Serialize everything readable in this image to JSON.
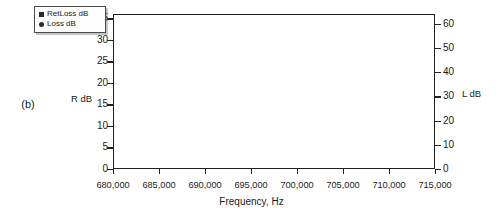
{
  "figure": {
    "panel_label": "(b)",
    "ylabel_left": "R dB",
    "ylabel_right": "L dB",
    "xlabel": "Frequency, Hz"
  },
  "legend": {
    "position": "top-left",
    "entries": [
      {
        "label": "RetLoss dB",
        "marker": "square-marker-icon",
        "color": "#2a2a2a"
      },
      {
        "label": "Loss dB",
        "marker": "round-marker-icon",
        "color": "#2a2a2a"
      }
    ]
  },
  "axes": {
    "x_ticks": [
      "680,000",
      "685,000",
      "690,000",
      "695,000",
      "700,000",
      "705,000",
      "710,000",
      "715,000"
    ],
    "y_ticks_left": [
      "0",
      "5",
      "10",
      "15",
      "20",
      "25",
      "30",
      "35"
    ],
    "y_ticks_right": [
      "0",
      "10",
      "20",
      "30",
      "40",
      "50",
      "60"
    ]
  },
  "chart_data": {
    "type": "line",
    "title": "",
    "xlabel": "Frequency, Hz",
    "ylabel": "R dB",
    "ylabel_secondary": "L dB",
    "xlim": [
      680000,
      715000
    ],
    "ylim": [
      0,
      36
    ],
    "ylim_secondary": [
      0,
      64
    ],
    "grid": true,
    "legend_position": "top-left",
    "series": [
      {
        "name": "Loss dB",
        "axis": "right",
        "marker": "round",
        "color": "#2a2a2a",
        "points": [
          [
            680000,
            64.0
          ],
          [
            680800,
            63.2
          ],
          [
            681600,
            62.2
          ],
          [
            682400,
            61.0
          ],
          [
            683200,
            59.7
          ],
          [
            684000,
            58.2
          ],
          [
            684800,
            56.6
          ],
          [
            685600,
            54.9
          ],
          [
            686400,
            53.0
          ],
          [
            687200,
            51.0
          ],
          [
            688000,
            48.8
          ],
          [
            688800,
            46.4
          ],
          [
            689600,
            43.8
          ],
          [
            690400,
            40.8
          ],
          [
            691200,
            37.5
          ],
          [
            691800,
            34.6
          ],
          [
            692400,
            31.2
          ],
          [
            692900,
            28.2
          ],
          [
            693200,
            25.8
          ],
          [
            693450,
            24.0
          ],
          [
            693600,
            26.5
          ],
          [
            693700,
            23.0
          ],
          [
            693800,
            10.0
          ],
          [
            693900,
            1.2
          ],
          [
            694100,
            0.5
          ],
          [
            695000,
            0.4
          ],
          [
            696000,
            0.4
          ],
          [
            697000,
            0.5
          ],
          [
            698000,
            0.5
          ],
          [
            699000,
            0.4
          ],
          [
            699800,
            0.5
          ],
          [
            700000,
            1.0
          ],
          [
            700150,
            10.0
          ],
          [
            700250,
            22.0
          ],
          [
            700400,
            25.5
          ],
          [
            700700,
            23.2
          ],
          [
            701000,
            21.6
          ],
          [
            701400,
            21.0
          ],
          [
            701800,
            22.0
          ],
          [
            702400,
            24.4
          ],
          [
            703200,
            28.2
          ],
          [
            704000,
            31.8
          ],
          [
            704800,
            35.2
          ],
          [
            705600,
            38.3
          ],
          [
            706400,
            41.2
          ],
          [
            707200,
            43.8
          ],
          [
            708000,
            46.2
          ],
          [
            708800,
            48.4
          ],
          [
            709600,
            50.4
          ],
          [
            710400,
            52.3
          ],
          [
            711200,
            54.0
          ],
          [
            712000,
            55.6
          ],
          [
            712800,
            57.1
          ],
          [
            713600,
            58.5
          ],
          [
            714400,
            59.8
          ],
          [
            715000,
            60.8
          ]
        ]
      },
      {
        "name": "RetLoss dB",
        "axis": "left",
        "marker": "triangle",
        "color": "#2a2a2a",
        "points": [
          [
            693350,
            0.2
          ],
          [
            693500,
            0.3
          ],
          [
            693600,
            4.5
          ],
          [
            693650,
            10.5
          ],
          [
            693700,
            16.5
          ],
          [
            693750,
            30.0
          ],
          [
            693820,
            16.0
          ],
          [
            693900,
            8.0
          ],
          [
            693980,
            0.4
          ],
          [
            694150,
            0.3
          ],
          [
            694300,
            11.5
          ],
          [
            694450,
            12.5
          ],
          [
            694600,
            13.0
          ],
          [
            694750,
            14.0
          ],
          [
            694900,
            15.2
          ],
          [
            695050,
            16.5
          ],
          [
            695200,
            17.8
          ],
          [
            695350,
            19.2
          ],
          [
            695500,
            20.8
          ],
          [
            695650,
            22.6
          ],
          [
            695800,
            25.0
          ],
          [
            695950,
            28.2
          ],
          [
            696100,
            33.0
          ],
          [
            696300,
            36.0
          ],
          [
            696500,
            31.5
          ],
          [
            696700,
            27.5
          ],
          [
            696900,
            25.5
          ],
          [
            697100,
            24.0
          ],
          [
            697300,
            22.0
          ],
          [
            697500,
            20.0
          ],
          [
            697700,
            18.2
          ],
          [
            697900,
            16.6
          ],
          [
            698100,
            15.4
          ],
          [
            698300,
            14.6
          ],
          [
            698500,
            14.2
          ],
          [
            698700,
            14.8
          ],
          [
            698900,
            16.0
          ],
          [
            699100,
            17.6
          ],
          [
            699300,
            19.6
          ],
          [
            699500,
            22.2
          ],
          [
            699700,
            25.2
          ],
          [
            699850,
            27.3
          ],
          [
            700000,
            25.0
          ],
          [
            700100,
            18.0
          ],
          [
            700200,
            10.5
          ],
          [
            700300,
            4.0
          ],
          [
            700400,
            0.4
          ],
          [
            700550,
            0.3
          ],
          [
            700700,
            0.2
          ]
        ]
      }
    ]
  }
}
